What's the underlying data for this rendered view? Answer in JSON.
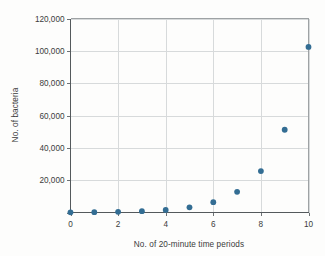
{
  "chart_data": {
    "type": "scatter",
    "title": "",
    "xlabel": "No. of 20-minute time periods",
    "ylabel": "No. of bacteria",
    "x": [
      0,
      1,
      2,
      3,
      4,
      5,
      6,
      7,
      8,
      9,
      10
    ],
    "values": [
      100,
      200,
      400,
      800,
      1600,
      3200,
      6400,
      12800,
      25600,
      51200,
      102400
    ],
    "xlim": [
      0,
      10
    ],
    "ylim": [
      0,
      120000
    ],
    "xticks": [
      0,
      2,
      4,
      6,
      8,
      10
    ],
    "xtick_labels": [
      "0",
      "2",
      "4",
      "6",
      "8",
      "10"
    ],
    "yticks": [
      0,
      20000,
      40000,
      60000,
      80000,
      100000,
      120000
    ],
    "ytick_labels": [
      "0",
      "20,000",
      "40,000",
      "60,000",
      "80,000",
      "100,000",
      "120,000"
    ],
    "ytick_labels_shown": [
      "20,000",
      "40,000",
      "60,000",
      "80,000",
      "100,000",
      "120,000"
    ],
    "grid": true,
    "grid_axis": "both",
    "legend": null,
    "marker_color": "#336d93",
    "grid_color": "#d7dadb",
    "axis_color": "#54595c",
    "background_color": "#fdfdfc"
  }
}
